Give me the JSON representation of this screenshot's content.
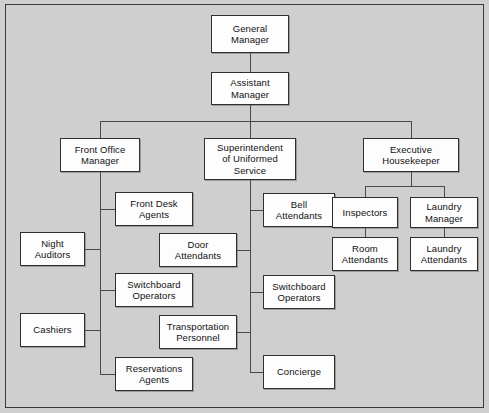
{
  "chart": {
    "background_color": "#cfcfcf",
    "node_fill_color": "#fdfdfd",
    "node_border_color": "#2f2f2f",
    "connector_color": "#4a4a4a",
    "frame_border_color": "#3a3a3a"
  },
  "nodes": {
    "general_manager": "General\nManager",
    "assistant_manager": "Assistant\nManager",
    "front_office_manager": "Front Office\nManager",
    "superintendent_uniformed_service": "Superintendent\nof Uniformed\nService",
    "executive_housekeeper": "Executive\nHousekeeper",
    "front_desk_agents": "Front Desk\nAgents",
    "night_auditors": "Night\nAuditors",
    "switchboard_operators_front": "Switchboard\nOperators",
    "cashiers": "Cashiers",
    "reservations_agents": "Reservations\nAgents",
    "door_attendants": "Door\nAttendants",
    "transportation_personnel": "Transportation\nPersonnel",
    "bell_attendants": "Bell\nAttendants",
    "switchboard_operators_uniformed": "Switchboard\nOperators",
    "concierge": "Concierge",
    "inspectors": "Inspectors",
    "room_attendants": "Room\nAttendants",
    "laundry_manager": "Laundry\nManager",
    "laundry_attendants": "Laundry\nAttendants"
  }
}
